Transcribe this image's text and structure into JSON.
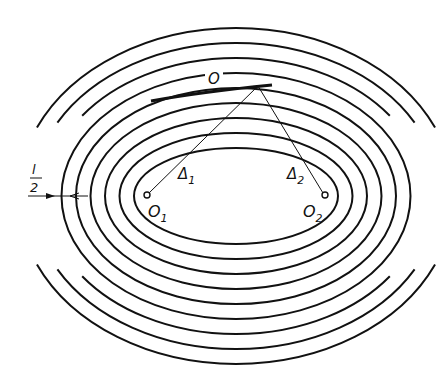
{
  "figure": {
    "labels": {
      "top_point": "O",
      "focus_left": "O",
      "focus_left_sub": "1",
      "focus_right": "O",
      "focus_right_sub": "2",
      "delta_left": "Δ",
      "delta_left_sub": "1",
      "delta_right": "Δ",
      "delta_right_sub": "2",
      "spacing_num": "l",
      "spacing_den": "2"
    },
    "geometry": {
      "center": [
        236,
        196
      ],
      "inner_rx": 102,
      "inner_ry": 48,
      "ring_step_x": 14.5,
      "ring_step_y": 15,
      "ring_count": 9,
      "focus_left": [
        147,
        195
      ],
      "focus_right": [
        325,
        195
      ],
      "top_point": [
        258,
        86
      ]
    },
    "colors": {
      "line": "#111111",
      "background": "#ffffff"
    }
  }
}
